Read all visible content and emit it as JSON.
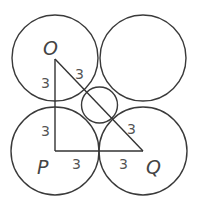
{
  "diagram": {
    "background": "#ffffff",
    "stroke_color": "#3a3a3a",
    "circles": [
      {
        "name": "circle-top-left",
        "cx": 55,
        "cy": 58,
        "r": 43
      },
      {
        "name": "circle-top-right",
        "cx": 143,
        "cy": 58,
        "r": 43
      },
      {
        "name": "circle-bottom-left",
        "cx": 55,
        "cy": 151,
        "r": 44
      },
      {
        "name": "circle-bottom-right",
        "cx": 143,
        "cy": 151,
        "r": 44
      },
      {
        "name": "circle-center-small",
        "cx": 99.5,
        "cy": 105,
        "r": 18
      }
    ],
    "triangle": {
      "vertices": {
        "O": {
          "x": 55,
          "y": 59
        },
        "P": {
          "x": 55,
          "y": 151
        },
        "Q": {
          "x": 143,
          "y": 151
        }
      }
    },
    "vertex_labels": {
      "O": "O",
      "P": "P",
      "Q": "Q"
    },
    "segment_labels": {
      "op_upper": "3",
      "op_lower": "3",
      "pq_left": "3",
      "pq_right": "3",
      "oq_upper": "3",
      "oq_lower": "3"
    }
  }
}
